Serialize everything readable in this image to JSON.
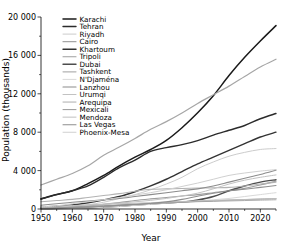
{
  "chart_data": {
    "type": "line",
    "title": "",
    "xlabel": "Year",
    "ylabel": "Population (thousands)",
    "xlim": [
      1950,
      2025
    ],
    "ylim": [
      0,
      20000
    ],
    "xticks": [
      1950,
      1960,
      1970,
      1980,
      1990,
      2000,
      2010,
      2020
    ],
    "xticklabels": [
      "1950",
      "1960",
      "1970",
      "1980",
      "1990",
      "2000",
      "2010",
      "2020"
    ],
    "yticks": [
      0,
      4000,
      8000,
      12000,
      16000,
      20000
    ],
    "yticklabels": [
      "0",
      "4 000",
      "8 000",
      "12 000",
      "16 000",
      "20 000"
    ],
    "grid": false,
    "legend_position": "upper left",
    "x": [
      1950,
      1955,
      1960,
      1965,
      1970,
      1975,
      1980,
      1985,
      1990,
      1995,
      2000,
      2005,
      2010,
      2015,
      2020,
      2025
    ],
    "series": [
      {
        "name": "Karachi",
        "color": "#1a1a1a",
        "linewidth": 1.5,
        "values": [
          1055,
          1500,
          1900,
          2650,
          3500,
          4500,
          5400,
          6200,
          7150,
          8470,
          10020,
          11800,
          13900,
          15800,
          17500,
          19100
        ]
      },
      {
        "name": "Tehran",
        "color": "#2b2b2b",
        "linewidth": 1.4,
        "values": [
          1041,
          1500,
          1900,
          2400,
          3300,
          4300,
          5100,
          6000,
          6400,
          6700,
          7130,
          7700,
          8200,
          8700,
          9400,
          9950
        ]
      },
      {
        "name": "Riyadh",
        "color": "#cccccc",
        "linewidth": 1.0,
        "values": [
          111,
          170,
          260,
          450,
          700,
          1100,
          1500,
          2000,
          2600,
          3300,
          4200,
          4900,
          5500,
          5900,
          6200,
          6300
        ]
      },
      {
        "name": "Cairo",
        "color": "#a6a6a6",
        "linewidth": 1.2,
        "values": [
          2494,
          3100,
          3700,
          4500,
          5600,
          6450,
          7350,
          8300,
          9100,
          10000,
          11000,
          11900,
          12800,
          13800,
          14800,
          15600
        ]
      },
      {
        "name": "Khartoum",
        "color": "#333333",
        "linewidth": 1.4,
        "values": [
          183,
          280,
          420,
          650,
          950,
          1300,
          1800,
          2400,
          3100,
          3900,
          4700,
          5400,
          6100,
          6800,
          7500,
          8000
        ]
      },
      {
        "name": "Tripoli",
        "color": "#9e9e9e",
        "linewidth": 1.1,
        "values": [
          107,
          160,
          230,
          330,
          480,
          660,
          880,
          1050,
          1200,
          1350,
          1500,
          1700,
          1900,
          2150,
          2500,
          2900
        ]
      },
      {
        "name": "Dubai",
        "color": "#4d4d4d",
        "linewidth": 1.4,
        "values": [
          20,
          35,
          60,
          110,
          180,
          280,
          400,
          520,
          620,
          720,
          938,
          1300,
          1900,
          2400,
          2800,
          3050
        ]
      },
      {
        "name": "Tashkent",
        "color": "#b3b3b3",
        "linewidth": 1.1,
        "values": [
          755,
          880,
          1000,
          1200,
          1400,
          1600,
          1850,
          2050,
          2100,
          2140,
          2180,
          2200,
          2250,
          2400,
          2600,
          2800
        ]
      },
      {
        "name": "N'Djaména",
        "color": "#d9d9d9",
        "linewidth": 1.0,
        "values": [
          18,
          30,
          60,
          110,
          180,
          260,
          380,
          480,
          600,
          720,
          830,
          960,
          1100,
          1300,
          1500,
          1700
        ]
      },
      {
        "name": "Lanzhou",
        "color": "#8c8c8c",
        "linewidth": 1.1,
        "values": [
          397,
          550,
          700,
          820,
          950,
          1100,
          1300,
          1500,
          1700,
          1900,
          2100,
          2400,
          2800,
          3200,
          3600,
          4050
        ]
      },
      {
        "name": "Urumqi",
        "color": "#c2c2c2",
        "linewidth": 1.0,
        "values": [
          140,
          200,
          300,
          400,
          500,
          620,
          750,
          900,
          1100,
          1350,
          1650,
          2100,
          2600,
          3000,
          3300,
          3550
        ]
      },
      {
        "name": "Arequipa",
        "color": "#adadad",
        "linewidth": 1.0,
        "values": [
          94,
          130,
          170,
          230,
          310,
          400,
          500,
          580,
          650,
          700,
          760,
          800,
          840,
          880,
          920,
          960
        ]
      },
      {
        "name": "Mexicali",
        "color": "#999999",
        "linewidth": 1.0,
        "values": [
          64,
          110,
          180,
          260,
          340,
          420,
          510,
          580,
          650,
          720,
          790,
          850,
          920,
          980,
          1030,
          1080
        ]
      },
      {
        "name": "Mendoza",
        "color": "#bfbfbf",
        "linewidth": 1.0,
        "values": [
          250,
          300,
          360,
          420,
          480,
          540,
          600,
          660,
          720,
          780,
          840,
          890,
          940,
          990,
          1040,
          1090
        ]
      },
      {
        "name": "Las Vegas",
        "color": "#8f8f8f",
        "linewidth": 1.1,
        "values": [
          35,
          70,
          120,
          190,
          280,
          380,
          470,
          570,
          740,
          1000,
          1330,
          1640,
          1900,
          2050,
          2250,
          2450
        ]
      },
      {
        "name": "Phoenix-Mesa",
        "color": "#d0d0d0",
        "linewidth": 1.0,
        "values": [
          221,
          330,
          550,
          750,
          970,
          1200,
          1450,
          1700,
          2000,
          2350,
          2700,
          3100,
          3500,
          3750,
          3950,
          4100
        ]
      }
    ]
  }
}
